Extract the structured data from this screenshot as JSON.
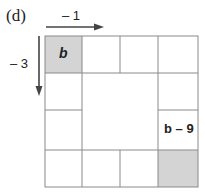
{
  "figure": {
    "panel_label": "(d)",
    "top_arrow_label": "– 1",
    "left_arrow_label": "– 3",
    "cells": {
      "top_left": {
        "text": "b",
        "shaded": true
      },
      "right_label_cell": {
        "text": "b – 9"
      },
      "bottom_right": {
        "shaded": true
      }
    },
    "colors": {
      "shade": "#d4d4d4",
      "line": "#8a8a8a",
      "arrow": "#444444"
    }
  }
}
